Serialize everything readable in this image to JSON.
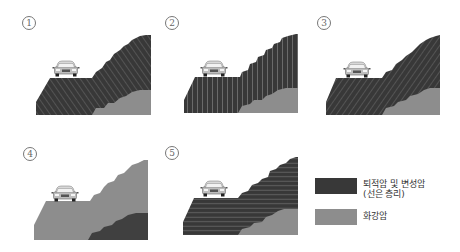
{
  "colors": {
    "sedimentary": "#3a3a3a",
    "hatch": "#6a6a6a",
    "granite": "#8c8c8c",
    "granite_alt": "#909090",
    "background": "#ffffff"
  },
  "panels": [
    {
      "marker": "①",
      "label": "1",
      "pattern": "diagonal-up",
      "main_rock": "sedimentary",
      "lower_rock": "granite"
    },
    {
      "marker": "②",
      "label": "2",
      "pattern": "vertical",
      "main_rock": "sedimentary",
      "lower_rock": "granite"
    },
    {
      "marker": "③",
      "label": "3",
      "pattern": "diagonal-down",
      "main_rock": "sedimentary",
      "lower_rock": "granite"
    },
    {
      "marker": "④",
      "label": "4",
      "pattern": "none",
      "main_rock": "granite",
      "lower_rock": "sedimentary"
    },
    {
      "marker": "⑤",
      "label": "5",
      "pattern": "horizontal",
      "main_rock": "sedimentary",
      "lower_rock": "granite"
    }
  ],
  "legend": {
    "items": [
      {
        "label_line1": "퇴적암 및 변성암",
        "label_line2": "(선은 층리)",
        "color": "#3a3a3a"
      },
      {
        "label_line1": "화강암",
        "label_line2": "",
        "color": "#8c8c8c"
      }
    ]
  }
}
